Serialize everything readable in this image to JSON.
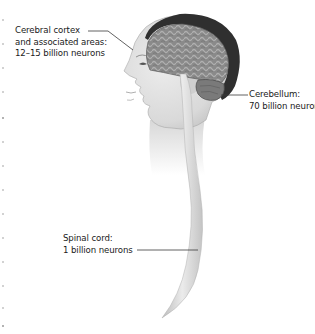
{
  "figure": {
    "labels": [
      {
        "id": "cerebral-cortex",
        "lines": [
          "Cerebral cortex",
          "and associated areas:",
          "12–15 billion neurons"
        ]
      },
      {
        "id": "cerebellum",
        "lines": [
          "Cerebellum:",
          "70 billion neurons"
        ]
      },
      {
        "id": "spinal-cord",
        "lines": [
          "Spinal cord:",
          "1 billion neurons"
        ]
      }
    ],
    "colors": {
      "brain": "#8e8e8e",
      "brain_dark": "#3a3a3a",
      "skin": "#e2e2e2",
      "skin_shade": "#c9c9c9",
      "spinal_cord": "#d6d6d6",
      "leader_line": "#3a3a3a",
      "text": "#1a1a1a"
    }
  }
}
